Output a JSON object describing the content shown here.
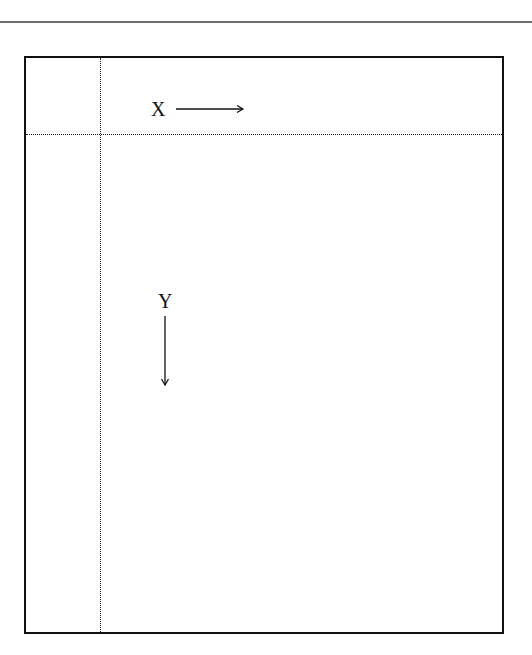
{
  "diagram": {
    "x_axis": {
      "label": "X",
      "direction": "right",
      "arrow_icon": "arrow-right-icon"
    },
    "y_axis": {
      "label": "Y",
      "direction": "down",
      "arrow_icon": "arrow-down-icon"
    },
    "colors": {
      "frame": "#111111",
      "top_rule": "#6e6e6e",
      "dashed": "#222222",
      "background": "#ffffff"
    }
  }
}
